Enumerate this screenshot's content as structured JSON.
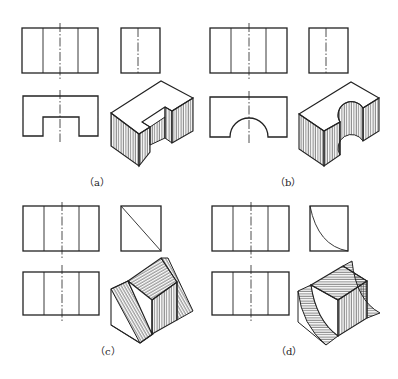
{
  "figure": {
    "panels": [
      {
        "id": "a",
        "label": "（a）",
        "description": "Rectangular block with rectangular slot cut from one side; front, side and top orthographic views plus hatched isometric view"
      },
      {
        "id": "b",
        "label": "（b）",
        "description": "Rectangular block with semicircular slot cut from one side; front, side and top orthographic views plus hatched isometric view"
      },
      {
        "id": "c",
        "label": "（c）",
        "description": "Block with planar diagonal cut (triangular side profile); orthographic views plus hatched isometric view"
      },
      {
        "id": "d",
        "label": "（d）",
        "description": "Block with concave curved cut (curved side profile); orthographic views plus hatched isometric view"
      }
    ],
    "colors": {
      "line": "#222222",
      "background": "#ffffff"
    }
  }
}
